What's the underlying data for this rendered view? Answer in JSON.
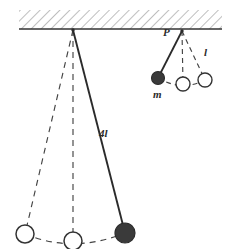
{
  "figure": {
    "width": 236,
    "height": 249,
    "background": "#ffffff",
    "ink_color": "#333333",
    "bob_fill_color": "#3a3a3a",
    "hatch_color": "#8a8a8a"
  },
  "ceiling": {
    "name": "hatched ceiling support",
    "x": 19,
    "y": 10,
    "width": 203,
    "height": 19,
    "baseline_y": 29,
    "hatch_angle_deg": 45
  },
  "labels": {
    "pivot_p": "P",
    "length_short": "l",
    "mass": "m",
    "length_long": "4l"
  },
  "pendulum_long": {
    "name": "long pendulum",
    "length_label": "4l",
    "pivot": {
      "x": 73,
      "y": 30
    },
    "bobs": [
      {
        "position": "left-extreme",
        "x": 25,
        "y": 234,
        "r": 9,
        "filled": false,
        "line": "dashed"
      },
      {
        "position": "equilibrium",
        "x": 73,
        "y": 241,
        "r": 9,
        "filled": false,
        "line": "dashed"
      },
      {
        "position": "right-extreme",
        "x": 125,
        "y": 233,
        "r": 10,
        "filled": true,
        "line": "solid"
      }
    ],
    "arc": "dashed swing arc through the three bob positions"
  },
  "pendulum_short": {
    "name": "short pendulum",
    "length_label": "l",
    "pivot_label": "P",
    "mass_label": "m",
    "pivot": {
      "x": 182,
      "y": 31
    },
    "bobs": [
      {
        "position": "left-extreme",
        "x": 158,
        "y": 78,
        "r": 6,
        "filled": true,
        "line": "solid"
      },
      {
        "position": "equilibrium",
        "x": 183,
        "y": 84,
        "r": 7,
        "filled": false,
        "line": "dashed"
      },
      {
        "position": "right-extreme",
        "x": 205,
        "y": 80,
        "r": 7,
        "filled": false,
        "line": "dashed"
      }
    ],
    "arc": "dashed swing arc through the three bob positions"
  }
}
